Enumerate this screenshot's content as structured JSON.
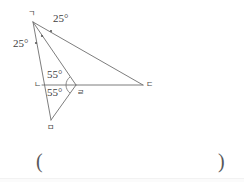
{
  "figure": {
    "name": "geometry-figure",
    "stroke_color": "#6e6e6e",
    "label_color": "#4a4a4a",
    "vertices": [
      {
        "id": "g",
        "label": "ㄱ",
        "name": "vertex-label-giyeok",
        "x": 33,
        "y": 22,
        "label_x": 28,
        "label_y": 10
      },
      {
        "id": "n",
        "label": "ㄴ",
        "name": "vertex-label-nieun",
        "x": 42,
        "y": 85,
        "label_x": 34,
        "label_y": 81
      },
      {
        "id": "d",
        "label": "ㄷ",
        "name": "vertex-label-digeut",
        "x": 143,
        "y": 85,
        "label_x": 146,
        "label_y": 81
      },
      {
        "id": "r",
        "label": "ㄹ",
        "name": "vertex-label-rieul",
        "x": 76,
        "y": 85,
        "label_x": 77,
        "label_y": 89
      },
      {
        "id": "m",
        "label": "ㅁ",
        "name": "vertex-label-mieum",
        "x": 51,
        "y": 120,
        "label_x": 47,
        "label_y": 124
      }
    ],
    "angles": [
      {
        "value": "25°",
        "name": "angle-label-25-top",
        "x": 53,
        "y": 13
      },
      {
        "value": "25°",
        "name": "angle-label-25-left",
        "x": 13,
        "y": 38
      },
      {
        "value": "55°",
        "name": "angle-label-55-upper",
        "x": 47,
        "y": 69
      },
      {
        "value": "55°",
        "name": "angle-label-55-lower",
        "x": 47,
        "y": 87
      }
    ]
  },
  "answer": {
    "open_paren": "(",
    "close_paren": ")",
    "value": ""
  }
}
